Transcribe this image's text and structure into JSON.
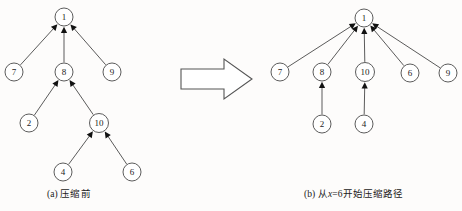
{
  "figure": {
    "title_semantic": "union-find-path-compression-diagram",
    "background_color": "#fdfcfb",
    "node_stroke_color": "#4a4a4a",
    "edge_color": "#3d3d3d",
    "arrow_fill_color": "#111111"
  },
  "panels": [
    {
      "id": "panel-a",
      "caption": "(a) 压缩前",
      "caption_parts": {
        "prefix": "(a) ",
        "text": "压缩前"
      },
      "nodes": [
        {
          "id": "1",
          "label": "1",
          "cx": 64,
          "cy": 17,
          "r": 9
        },
        {
          "id": "7",
          "label": "7",
          "cx": 14,
          "cy": 72,
          "r": 9
        },
        {
          "id": "8",
          "label": "8",
          "cx": 64,
          "cy": 72,
          "r": 9
        },
        {
          "id": "9",
          "label": "9",
          "cx": 112,
          "cy": 72,
          "r": 9
        },
        {
          "id": "2",
          "label": "2",
          "cx": 29,
          "cy": 123,
          "r": 9
        },
        {
          "id": "10",
          "label": "10",
          "cx": 99,
          "cy": 123,
          "r": 9.5
        },
        {
          "id": "4",
          "label": "4",
          "cx": 63,
          "cy": 172,
          "r": 9
        },
        {
          "id": "6",
          "label": "6",
          "cx": 132,
          "cy": 172,
          "r": 9
        }
      ],
      "edges": [
        {
          "from": "7",
          "to": "1"
        },
        {
          "from": "8",
          "to": "1"
        },
        {
          "from": "9",
          "to": "1"
        },
        {
          "from": "2",
          "to": "8"
        },
        {
          "from": "10",
          "to": "8"
        },
        {
          "from": "4",
          "to": "10"
        },
        {
          "from": "6",
          "to": "10"
        }
      ]
    },
    {
      "id": "panel-b",
      "caption": "(b) 从x=6开始压缩路径",
      "caption_parts": {
        "prefix": "(b) ",
        "pre": "从",
        "var": "x",
        "post": "=6开始压缩路径"
      },
      "nodes": [
        {
          "id": "1",
          "label": "1",
          "cx": 364,
          "cy": 18,
          "r": 9
        },
        {
          "id": "7",
          "label": "7",
          "cx": 280,
          "cy": 72,
          "r": 9
        },
        {
          "id": "8",
          "label": "8",
          "cx": 322,
          "cy": 72,
          "r": 9
        },
        {
          "id": "10",
          "label": "10",
          "cx": 365,
          "cy": 72,
          "r": 9.5
        },
        {
          "id": "6",
          "label": "6",
          "cx": 410,
          "cy": 73,
          "r": 9
        },
        {
          "id": "9",
          "label": "9",
          "cx": 448,
          "cy": 73,
          "r": 9
        },
        {
          "id": "2",
          "label": "2",
          "cx": 322,
          "cy": 124,
          "r": 9
        },
        {
          "id": "4",
          "label": "4",
          "cx": 364,
          "cy": 124,
          "r": 9
        }
      ],
      "edges": [
        {
          "from": "7",
          "to": "1"
        },
        {
          "from": "8",
          "to": "1"
        },
        {
          "from": "10",
          "to": "1"
        },
        {
          "from": "6",
          "to": "1"
        },
        {
          "from": "9",
          "to": "1"
        },
        {
          "from": "2",
          "to": "8"
        },
        {
          "from": "4",
          "to": "10"
        }
      ]
    }
  ],
  "transition_arrow": {
    "name": "right-arrow",
    "x_start": 181,
    "x_end": 252,
    "y_top": 59,
    "y_bottom": 99
  }
}
